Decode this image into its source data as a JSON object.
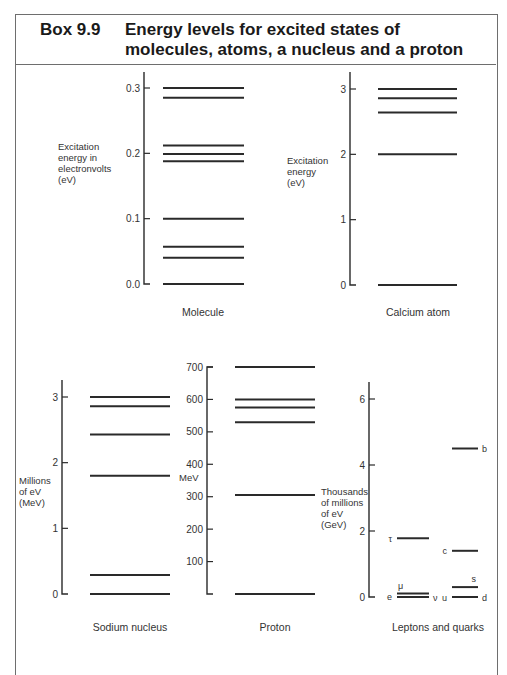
{
  "header": {
    "box_number": "Box 9.9",
    "title": "Energy levels for excited states of molecules, atoms, a nucleus and a proton"
  },
  "chart_data": [
    {
      "type": "energy-level",
      "title": "Molecule",
      "ylabel": "Excitation energy in electronvolts (eV)",
      "ylim": [
        0,
        0.3
      ],
      "ticks": [
        "0.0",
        "0.1",
        "0.2",
        "0.3"
      ],
      "levels": [
        0.0,
        0.04,
        0.057,
        0.1,
        0.188,
        0.199,
        0.212,
        0.285,
        0.3
      ]
    },
    {
      "type": "energy-level",
      "title": "Calcium atom",
      "ylabel": "Excitation energy (eV)",
      "ylim": [
        0,
        3
      ],
      "ticks": [
        "0",
        "1",
        "2",
        "3"
      ],
      "levels": [
        0,
        2.0,
        2.64,
        2.86,
        3.0
      ]
    },
    {
      "type": "energy-level",
      "title": "Sodium nucleus",
      "ylabel": "Millions of eV (MeV)",
      "ylim": [
        0,
        3
      ],
      "ticks": [
        "0",
        "1",
        "2",
        "3"
      ],
      "levels": [
        0,
        0.29,
        1.8,
        2.43,
        2.86,
        3.0
      ]
    },
    {
      "type": "energy-level",
      "title": "Proton",
      "ylabel": "MeV",
      "ylim": [
        0,
        700
      ],
      "ticks": [
        "100",
        "200",
        "300",
        "400",
        "500",
        "600",
        "700"
      ],
      "levels": [
        0,
        305,
        530,
        575,
        600,
        700
      ]
    },
    {
      "type": "energy-level",
      "title": "Leptons and quarks",
      "ylabel": "Thousands of millions of eV (GeV)",
      "ylim": [
        0,
        6
      ],
      "ticks": [
        "0",
        "2",
        "4",
        "6"
      ],
      "series": [
        {
          "name": "Leptons",
          "levels": [
            {
              "label": "e",
              "value": 0.0005,
              "side": "left"
            },
            {
              "label": "ν",
              "value": 0.0,
              "side": "right"
            },
            {
              "label": "μ",
              "value": 0.106,
              "side": "above"
            },
            {
              "label": "τ",
              "value": 1.78,
              "side": "left"
            }
          ]
        },
        {
          "name": "Quarks",
          "levels": [
            {
              "label": "u",
              "value": 0.0,
              "side": "left"
            },
            {
              "label": "d",
              "value": 0.0,
              "side": "right"
            },
            {
              "label": "s",
              "value": 0.3,
              "side": "above"
            },
            {
              "label": "c",
              "value": 1.4,
              "side": "left"
            },
            {
              "label": "b",
              "value": 4.5,
              "side": "right"
            }
          ]
        }
      ]
    }
  ],
  "labels": {
    "molecule_axis": [
      "Excitation",
      "energy in",
      "electronvolts",
      "(eV)"
    ],
    "calcium_axis": [
      "Excitation",
      "energy",
      "(eV)"
    ],
    "sodium_axis": [
      "Millions",
      "of eV",
      "(MeV)"
    ],
    "proton_axis": "MeV",
    "lepton_axis": [
      "Thousands",
      "of millions",
      "of eV",
      "(GeV)"
    ]
  }
}
